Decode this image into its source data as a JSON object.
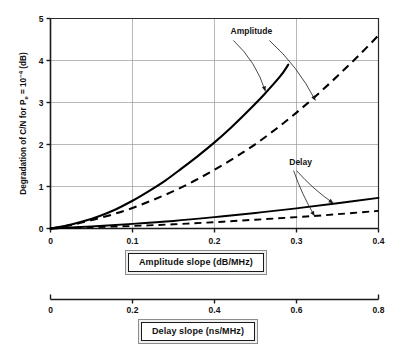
{
  "chart_data": {
    "type": "line",
    "title": "",
    "ylabel": "Degradation of C/N for Pe = 10-4 (dB)",
    "ylabel_parts": {
      "lead": "Degradation of C/N for P",
      "sub": "e",
      "mid": " = 10",
      "sup": "−4",
      "tail": " (dB)"
    },
    "xlabel_primary": "Amplitude slope (dB/MHz)",
    "xlabel_secondary": "Delay slope (ns/MHz)",
    "grid": true,
    "legend": "annotations",
    "ylim": [
      0,
      5
    ],
    "yticks": [
      "0",
      "1",
      "2",
      "3",
      "4",
      "5"
    ],
    "ytick_values": [
      0,
      1,
      2,
      3,
      4,
      5
    ],
    "xlim_primary": [
      0,
      0.4
    ],
    "xticks_primary": [
      "0",
      "0.1",
      "0.2",
      "0.3",
      "0.4"
    ],
    "xtick_values_primary": [
      0,
      0.1,
      0.2,
      0.3,
      0.4
    ],
    "xlim_secondary": [
      0,
      0.8
    ],
    "xticks_secondary": [
      "0",
      "0.2",
      "0.4",
      "0.6",
      "0.8"
    ],
    "xtick_values_secondary": [
      0,
      0.2,
      0.4,
      0.6,
      0.8
    ],
    "annotations": [
      {
        "label": "Amplitude",
        "x": 0.245,
        "y": 4.62
      },
      {
        "label": "Delay",
        "x": 0.305,
        "y": 1.52
      }
    ],
    "series": [
      {
        "name": "Amplitude (solid)",
        "style": "solid",
        "group": "Amplitude",
        "points": [
          [
            0.0,
            0.0
          ],
          [
            0.02,
            0.07
          ],
          [
            0.04,
            0.17
          ],
          [
            0.06,
            0.3
          ],
          [
            0.08,
            0.46
          ],
          [
            0.1,
            0.66
          ],
          [
            0.12,
            0.89
          ],
          [
            0.14,
            1.14
          ],
          [
            0.16,
            1.43
          ],
          [
            0.18,
            1.73
          ],
          [
            0.2,
            2.05
          ],
          [
            0.22,
            2.4
          ],
          [
            0.24,
            2.78
          ],
          [
            0.26,
            3.18
          ],
          [
            0.28,
            3.62
          ],
          [
            0.29,
            3.9
          ]
        ]
      },
      {
        "name": "Amplitude (dashed)",
        "style": "dashed",
        "group": "Amplitude",
        "points": [
          [
            0.0,
            0.0
          ],
          [
            0.025,
            0.08
          ],
          [
            0.05,
            0.2
          ],
          [
            0.075,
            0.33
          ],
          [
            0.1,
            0.49
          ],
          [
            0.125,
            0.68
          ],
          [
            0.15,
            0.89
          ],
          [
            0.175,
            1.13
          ],
          [
            0.2,
            1.4
          ],
          [
            0.225,
            1.69
          ],
          [
            0.25,
            2.01
          ],
          [
            0.275,
            2.37
          ],
          [
            0.3,
            2.76
          ],
          [
            0.325,
            3.18
          ],
          [
            0.35,
            3.63
          ],
          [
            0.375,
            4.1
          ],
          [
            0.4,
            4.6
          ]
        ]
      },
      {
        "name": "Delay (solid)",
        "style": "solid",
        "group": "Delay",
        "points": [
          [
            0.0,
            0.0
          ],
          [
            0.05,
            0.05
          ],
          [
            0.1,
            0.11
          ],
          [
            0.15,
            0.18
          ],
          [
            0.2,
            0.27
          ],
          [
            0.25,
            0.37
          ],
          [
            0.3,
            0.48
          ],
          [
            0.35,
            0.6
          ],
          [
            0.4,
            0.73
          ]
        ]
      },
      {
        "name": "Delay (dashed)",
        "style": "dashed",
        "group": "Delay",
        "points": [
          [
            0.0,
            0.0
          ],
          [
            0.05,
            0.03
          ],
          [
            0.1,
            0.06
          ],
          [
            0.15,
            0.1
          ],
          [
            0.2,
            0.15
          ],
          [
            0.25,
            0.21
          ],
          [
            0.3,
            0.27
          ],
          [
            0.35,
            0.34
          ],
          [
            0.4,
            0.42
          ]
        ]
      }
    ],
    "colors": {
      "curve": "#000000",
      "grid": "#9a9a9a",
      "axis": "#1a1a1a",
      "caption_border": "#1a1a1a",
      "caption_shadow": "#8c8c8c"
    }
  }
}
